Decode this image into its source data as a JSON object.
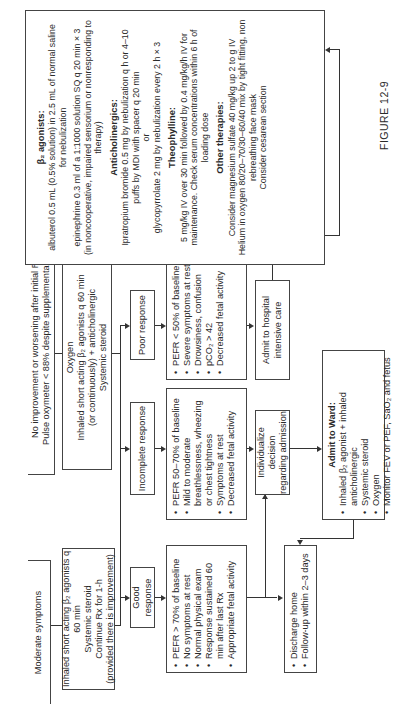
{
  "figure_label": "FIGURE 12-9",
  "start": {
    "moderate": "Moderate symptoms",
    "initial_rx": [
      "Inhaled short acting β₂ agonists q 60 min",
      "Systemic steroid",
      "Continue Rx for 1-h",
      "(provided there is improvement)"
    ],
    "no_improvement": [
      "No improvement or worsening after initial Rx",
      "Pulse oxymeter < 88% despite supplemental O₂"
    ],
    "oxygen_rx": [
      "Oxygen",
      "Inhaled short acting β₂ agonists q 60 min",
      "(or continuously) + anticholinergic",
      "Systemic steroid"
    ]
  },
  "responses": {
    "good": "Good response",
    "incomplete": "Incomplete response",
    "poor": "Poor response"
  },
  "details": {
    "good": [
      "PEFR > 70% of baseline",
      "No symptoms at rest",
      "Normal physical exam",
      "Response sustained 60 min after last Rx",
      "Appropriate fetal activity"
    ],
    "incomplete": [
      "PEFR 50–70% of baseline",
      "Mild to moderate breathlessness, wheezing or chest tightness",
      "Symptoms at rest",
      "Decreased fetal activity"
    ],
    "poor": [
      "PEFR < 50% of baseline",
      "Severe symptoms at rest",
      "Drowsiness, confusion",
      "pCO₂ > 42",
      "Decreased fetal activity"
    ]
  },
  "outcomes": {
    "discharge": [
      "Discharge home",
      "Follow-up within 2–3 days"
    ],
    "individualize": [
      "Individualize decision",
      "regarding admission"
    ],
    "icu": [
      "Admit to hospital",
      "intensive care"
    ],
    "ward_title": "Admit to Ward:",
    "ward": [
      "Inhaled β₂ agonist + inhaled anticholinergic",
      "Systemic steroid",
      "Oxygen",
      "Monitor FEV or PEF, SaO₂ and fetus"
    ]
  },
  "therapies": {
    "beta_title": "β₂ agonists:",
    "beta_1": "albuterol 0.5 mL (0.5% solution) in 2.5 mL of normal saline for nebulization",
    "beta_2": "epinephrine 0.3 ml of a 1:1000 solution SQ q 20 min × 3",
    "beta_3": "(in noncooperative, impaired sensorium or nonresponding to therapy)",
    "anti_title": "Anticholinergics:",
    "anti_1": "Ipratropium bromide 0.5 mg by nebulization q h or 4–10 puffs by MDI with spacer q 20 min",
    "anti_or": "or",
    "anti_2": "glycopyrrolate 2 mg by nebulization every 2 h × 3",
    "theo_title": "Theophylline:",
    "theo_1": "5 mg/kg IV over 30 min followed by 0.4 mg/kg/h IV for maintenance. Check serum concentrations within 6 h of loading dose",
    "other_title": "Other therapies:",
    "other_1": "Consider magnesium sulfate 40 mg/kg up 2 to g IV",
    "other_2": "Helium in oxygen 80/20–70/30–60/40 mix by tight fitting, non rebreathing face mask",
    "other_3": "Consider cesarean section"
  }
}
